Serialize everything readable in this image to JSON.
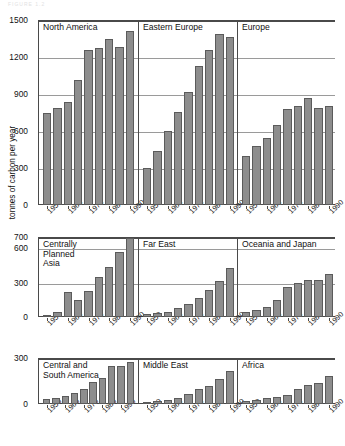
{
  "figure": {
    "faint_header_text": "FIGURE 1.2",
    "ylabel": "tonnes of carbon per year",
    "bar_fill_color": "#8d8d8d",
    "bar_edge_color": "#5b5b5b",
    "axis_color": "#4a4a4a",
    "grid_color": "#9a9a9a",
    "background_color": "#ffffff"
  },
  "chart_data": {
    "type": "bar",
    "title": "",
    "subtitle": "",
    "xlabel": "",
    "ylabel": "tonnes of carbon per year",
    "grid": true,
    "legend": "none",
    "x": [
      1950,
      1955,
      1960,
      1965,
      1970,
      1975,
      1980,
      1985,
      1990
    ],
    "facet_layout": [
      3,
      3
    ],
    "rows": [
      {
        "ylim": [
          0,
          1500
        ],
        "yticks": [
          0,
          300,
          600,
          900,
          1200,
          1500
        ],
        "ytick_labels": [
          "0",
          "300",
          "600",
          "900",
          "1200",
          "1500"
        ],
        "panels": [
          {
            "title": "North America",
            "categories": [
              "1950",
              "1955",
              "1960",
              "1965",
              "1970",
              "1975",
              "1980",
              "1985",
              "1990"
            ],
            "values": [
              745,
              790,
              835,
              1010,
              1255,
              1275,
              1350,
              1285,
              1410
            ]
          },
          {
            "title": "Eastern Europe",
            "categories": [
              "1950",
              "1955",
              "1960",
              "1965",
              "1970",
              "1975",
              "1980",
              "1985",
              "1990"
            ],
            "values": [
              300,
              440,
              600,
              755,
              915,
              1125,
              1260,
              1390,
              1365
            ]
          },
          {
            "title": "Europe",
            "categories": [
              "1950",
              "1955",
              "1960",
              "1965",
              "1970",
              "1975",
              "1980",
              "1985",
              "1990"
            ],
            "values": [
              395,
              480,
              540,
              645,
              780,
              805,
              865,
              785,
              805
            ]
          }
        ]
      },
      {
        "ylim": [
          0,
          700
        ],
        "yticks": [
          0,
          300,
          600,
          700
        ],
        "ytick_labels": [
          "0",
          "300",
          "600",
          "700"
        ],
        "panels": [
          {
            "title": "Centrally\nPlanned\nAsia",
            "categories": [
              "1950",
              "1955",
              "1960",
              "1965",
              "1970",
              "1975",
              "1980",
              "1985",
              "1990"
            ],
            "values": [
              15,
              45,
              215,
              150,
              230,
              350,
              435,
              570,
              695
            ]
          },
          {
            "title": "Far East",
            "categories": [
              "1950",
              "1955",
              "1960",
              "1965",
              "1970",
              "1975",
              "1980",
              "1985",
              "1990"
            ],
            "values": [
              25,
              35,
              45,
              75,
              110,
              165,
              235,
              315,
              425
            ]
          },
          {
            "title": "Oceania and Japan",
            "categories": [
              "1950",
              "1955",
              "1960",
              "1965",
              "1970",
              "1975",
              "1980",
              "1985",
              "1990"
            ],
            "values": [
              40,
              60,
              85,
              145,
              265,
              295,
              320,
              325,
              380
            ]
          }
        ]
      },
      {
        "ylim": [
          0,
          300
        ],
        "yticks": [
          0,
          300
        ],
        "ytick_labels": [
          "0",
          "300"
        ],
        "panels": [
          {
            "title": "Central and\nSouth America",
            "categories": [
              "1950",
              "1955",
              "1960",
              "1965",
              "1970",
              "1975",
              "1980",
              "1985",
              "1990"
            ],
            "values": [
              30,
              40,
              55,
              70,
              100,
              145,
              170,
              245,
              250,
              275
            ]
          },
          {
            "title": "Middle East",
            "categories": [
              "1950",
              "1955",
              "1960",
              "1965",
              "1970",
              "1975",
              "1980",
              "1985",
              "1990"
            ],
            "values": [
              10,
              18,
              25,
              40,
              65,
              95,
              120,
              160,
              215
            ]
          },
          {
            "title": "Africa",
            "categories": [
              "1950",
              "1955",
              "1960",
              "1965",
              "1970",
              "1975",
              "1980",
              "1985",
              "1990"
            ],
            "values": [
              20,
              28,
              38,
              48,
              62,
              95,
              125,
              140,
              180
            ]
          }
        ]
      }
    ],
    "xtick_labels": [
      "1950",
      "1960",
      "1970",
      "1980",
      "1990"
    ],
    "xtick_indices": [
      0,
      2,
      4,
      6,
      8
    ]
  }
}
